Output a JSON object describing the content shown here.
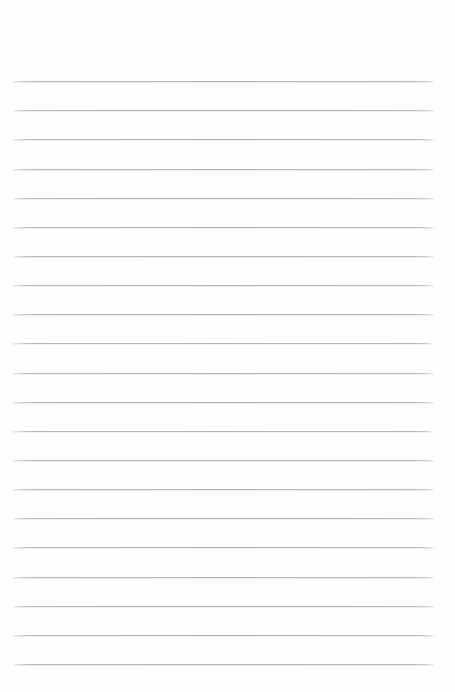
{
  "page": {
    "kind": "lined-paper",
    "width": 455,
    "height": 692,
    "background_color": "#fefefe",
    "text_content": "",
    "has_text": false,
    "has_margin_rule": false,
    "has_header": false,
    "has_holes": false
  },
  "ruling": {
    "line_color": "#b9b9b9",
    "line_thickness_px": 1,
    "line_count": 21,
    "line_left_x": 13,
    "line_right_x": 434,
    "line_width_px": 421,
    "first_line_y": 81,
    "last_line_y": 664,
    "line_spacing_px": 29.15,
    "top_margin_px": 81,
    "bottom_margin_px": 28,
    "end_fade": true,
    "line_y_positions": [
      81,
      110.2,
      139.3,
      168.5,
      197.6,
      226.8,
      255.9,
      285.1,
      314.2,
      343.4,
      372.5,
      401.7,
      430.8,
      460,
      489.1,
      518.3,
      547.4,
      576.6,
      605.7,
      634.9,
      664
    ]
  }
}
